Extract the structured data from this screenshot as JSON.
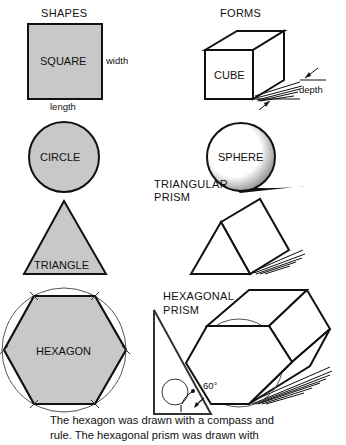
{
  "headers": {
    "shapes": "SHAPES",
    "forms": "FORMS"
  },
  "shapes": {
    "square": {
      "label": "SQUARE",
      "width_label": "width",
      "length_label": "length"
    },
    "circle": {
      "label": "CIRCLE"
    },
    "triangle": {
      "label": "TRIANGLE"
    },
    "hexagon": {
      "label": "HEXAGON"
    }
  },
  "forms": {
    "cube": {
      "label": "CUBE",
      "depth_label": "depth"
    },
    "sphere": {
      "label": "SPHERE"
    },
    "triangular_prism": {
      "label_line1": "TRIANGULAR",
      "label_line2": "PRISM"
    },
    "hexagonal_prism": {
      "label_line1": "HEXAGONAL",
      "label_line2": "PRISM",
      "angle_label": "60°"
    }
  },
  "caption": {
    "line1": "The hexagon was drawn with a compass and",
    "line2": "rule.  The hexagonal prism was drawn with"
  },
  "colors": {
    "fill_gray": "#c8c8c8",
    "stroke": "#111111"
  }
}
